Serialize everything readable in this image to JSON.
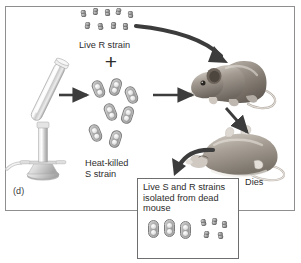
{
  "figure": {
    "panel_label": "(d)",
    "domain_type": "biology-experiment-diagram",
    "description_title": "Griffith transformation experiment panel d"
  },
  "labels": {
    "live_r_strain": "Live R strain",
    "heat_killed_s_strain": "Heat-killed\nS strain",
    "dies": "Dies",
    "plus": "+",
    "inset_caption": "Live S and R strains\nisolated from dead\nmouse"
  },
  "elements": {
    "burner_name": "bunsen-burner-with-test-tube",
    "live_mouse_name": "live-mouse",
    "dead_mouse_name": "dead-mouse",
    "inset_box_name": "result-inset-box"
  },
  "bacteria": {
    "r_strain_top_row_count": 5,
    "r_strain_bottom_row_count": 4,
    "s_strain_count": 7,
    "inset_s_strain_count": 3,
    "inset_r_strain_count": 5
  },
  "arrows": [
    {
      "name": "arrow-r-strain-to-mouse",
      "style": "thick-curved",
      "from": "live-r-strain",
      "to": "live-mouse"
    },
    {
      "name": "arrow-burner-to-s-strain",
      "style": "straight-horizontal",
      "from": "bunsen-burner",
      "to": "heat-killed-s-strain"
    },
    {
      "name": "arrow-mixture-to-mouse",
      "style": "straight-horizontal",
      "from": "bacteria-mixture",
      "to": "live-mouse"
    },
    {
      "name": "arrow-mouse-to-dead-mouse",
      "style": "straight-diagonal",
      "from": "live-mouse",
      "to": "dead-mouse"
    },
    {
      "name": "arrow-dead-mouse-to-inset",
      "style": "thick-curved",
      "from": "dead-mouse",
      "to": "result-inset-box"
    }
  ],
  "colors": {
    "frame_border": "#8f8f8f",
    "inset_border": "#6e6e6e",
    "text": "#2e2e2e",
    "arrow": "#3c3c3c",
    "bacteria_gray": "#8d8d8d",
    "background": "#ffffff"
  }
}
